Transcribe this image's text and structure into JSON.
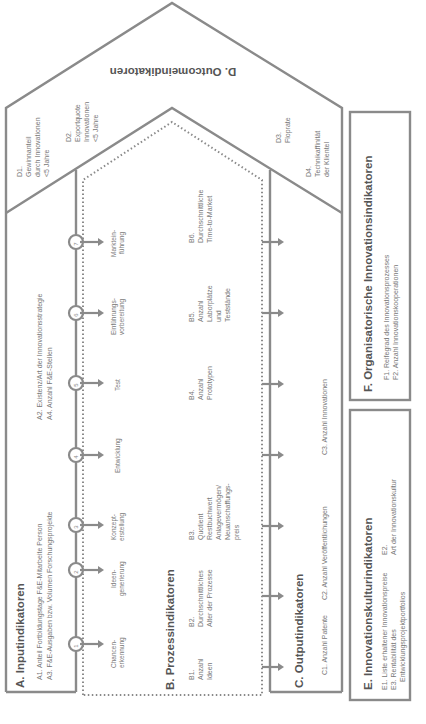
{
  "diagram": {
    "orientation": "rotated-90-ccw",
    "colors": {
      "outline": "#8a8a8a",
      "text": "#6a6a6a",
      "title": "#555555",
      "background": "#ffffff"
    },
    "sections": {
      "A": {
        "title": "A. Inputindikatoren",
        "items": [
          "A1. Anteil Fortbildungstage F&E-Mitarbeite Person",
          "A3. F&E-Ausgaben bzw. Volumen Forschungsprojekte",
          "A2. Existenz/Art der Innovationsstrategie",
          "A4. Anzahl F&E-Stellen"
        ]
      },
      "B": {
        "title": "B. Prozessindikatoren",
        "items": [
          {
            "id": "B1.",
            "lines": [
              "Anzahl",
              "Ideen"
            ]
          },
          {
            "id": "B2.",
            "lines": [
              "Durchschnittliches",
              "Alter der Prozesse"
            ]
          },
          {
            "id": "B3.",
            "lines": [
              "Quotient",
              "Restbuchwert",
              "Anlagevermögen/",
              "Neuanschaffungs-",
              "preis"
            ]
          },
          {
            "id": "B4.",
            "lines": [
              "Anzahl",
              "Prototypen"
            ]
          },
          {
            "id": "B5.",
            "lines": [
              "Anzahl",
              "Laborplätze",
              "und",
              "Teststände"
            ]
          },
          {
            "id": "B6.",
            "lines": [
              "Durchschnittliche",
              "Time-to-Market"
            ]
          }
        ]
      },
      "C": {
        "title": "C. Outputindikatoren",
        "items": [
          "C1. Anzahl Patente",
          "C2. Anzahl Veröffentlichungen",
          "C3. Anzahl Innovationen"
        ]
      },
      "D": {
        "title": "D. Outcomeindikatoren",
        "items": [
          {
            "id": "D1.",
            "lines": [
              "Gewinnanteil",
              "durch Innovationen",
              "<5 Jahre"
            ]
          },
          {
            "id": "D2.",
            "lines": [
              "Exportquote",
              "Innovationen",
              "<5 Jahre"
            ]
          },
          {
            "id": "D3.",
            "lines": [
              "Floprate"
            ]
          },
          {
            "id": "D4.",
            "lines": [
              "Technikaffinität",
              "der Klientel"
            ]
          }
        ]
      },
      "E": {
        "title": "E. Innovationskulturindikatoren",
        "items": [
          "E1. Liste erhaltener Innovationspreise",
          "E3. Rentabilität des",
          "Entwicklungsprojektportfolios",
          "E2.",
          "Art der Innovationskultur"
        ]
      },
      "F": {
        "title": "F. Organisatorische Innovationsindikatoren",
        "items": [
          "F1. Reifegrad des Innovationsprozesses",
          "F2. Anzahl Innovationskooperationen"
        ]
      }
    },
    "process_steps": [
      {
        "num": "1",
        "lines": [
          "Chancen-",
          "erkennung"
        ]
      },
      {
        "num": "2",
        "lines": [
          "Ideen-",
          "generierung"
        ]
      },
      {
        "num": "3",
        "lines": [
          "Konzept-",
          "erstellung"
        ]
      },
      {
        "num": "4",
        "lines": [
          "Entwicklung"
        ]
      },
      {
        "num": "5",
        "lines": [
          "Test"
        ]
      },
      {
        "num": "6",
        "lines": [
          "Einführungs-",
          "vorbereitung"
        ]
      },
      {
        "num": "7",
        "lines": [
          "Marktein-",
          "führung"
        ]
      }
    ]
  }
}
